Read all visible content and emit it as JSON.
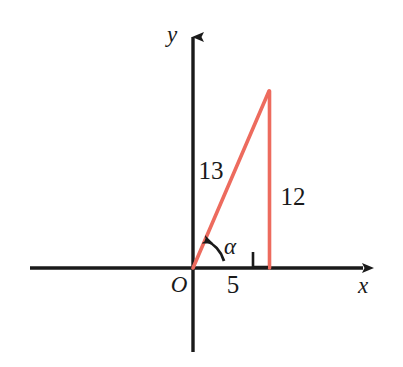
{
  "figure": {
    "kind": "coordinate-plane-right-triangle-diagram",
    "background_color": "#ffffff",
    "axis_color": "#1a1a1a",
    "triangle_color": "#ED6B5E",
    "label_color": "#1a1a1a"
  },
  "axes": {
    "x_axis_label": "x",
    "y_axis_label": "y",
    "origin_label": "O",
    "x_axis": {
      "start_x": 30,
      "end_x": 372,
      "y": 268,
      "arrow": "right"
    },
    "y_axis": {
      "x": 193,
      "top_y": 28,
      "bottom_y": 352,
      "arrow": "up"
    }
  },
  "triangle": {
    "vertices": {
      "origin": {
        "x": 193,
        "y": 268
      },
      "apex": {
        "x": 269,
        "y": 91
      },
      "foot": {
        "x": 269,
        "y": 268
      }
    },
    "hypotenuse_label": "13",
    "vertical_leg_label": "12",
    "horizontal_leg_label": "5",
    "angle_label": "α",
    "right_angle_marker": true
  },
  "labels": [
    {
      "text": "y",
      "name": "y-axis-label",
      "x": 172,
      "y": 42,
      "size": 23,
      "italic": true
    },
    {
      "text": "x",
      "name": "x-axis-label",
      "x": 358,
      "y": 293,
      "size": 23,
      "italic": true
    },
    {
      "text": "O",
      "name": "origin-label",
      "x": 171,
      "y": 292,
      "size": 23,
      "italic": true
    },
    {
      "text": "13",
      "name": "hypotenuse-length-label",
      "x": 199,
      "y": 179,
      "size": 24,
      "italic": false
    },
    {
      "text": "12",
      "name": "vertical-leg-length-label",
      "x": 281,
      "y": 205,
      "size": 24,
      "italic": false
    },
    {
      "text": "5",
      "name": "horizontal-leg-length-label",
      "x": 227,
      "y": 293,
      "size": 24,
      "italic": false
    },
    {
      "text": "α",
      "name": "angle-alpha-label",
      "x": 222,
      "y": 254,
      "size": 23,
      "italic": true
    }
  ]
}
